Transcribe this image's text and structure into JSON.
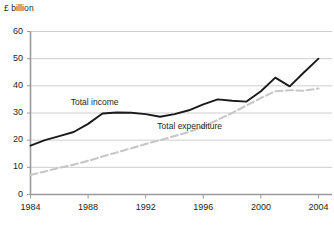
{
  "chart_data": {
    "type": "line",
    "title": "",
    "subtitle": "",
    "ylabel": "£ billion",
    "xlabel": "",
    "ylim": [
      0,
      60
    ],
    "xlim": [
      1984,
      2004
    ],
    "yticks": [
      "0",
      "10",
      "20",
      "30",
      "40",
      "50",
      "60"
    ],
    "ytick_values": [
      0,
      10,
      20,
      30,
      40,
      50,
      60
    ],
    "xticks": [
      "1984",
      "1988",
      "1992",
      "1996",
      "2000",
      "2004"
    ],
    "xtick_values": [
      1984,
      1988,
      1992,
      1996,
      2000,
      2004
    ],
    "grid": true,
    "grid_axis": "y",
    "legend": "inline-annotations",
    "x": [
      1984,
      1985,
      1986,
      1987,
      1988,
      1989,
      1990,
      1991,
      1992,
      1993,
      1994,
      1995,
      1996,
      1997,
      1998,
      1999,
      2000,
      2001,
      2002,
      2003,
      2004
    ],
    "series": [
      {
        "name": "Total income",
        "style": "solid",
        "color": "#1a1a1a",
        "width": 1.9,
        "label_x": 1988.6,
        "label_y": 33.5,
        "values": [
          18.0,
          20.0,
          21.5,
          23.0,
          26.0,
          29.8,
          30.2,
          30.1,
          29.6,
          28.6,
          29.6,
          31.0,
          33.2,
          35.0,
          34.5,
          34.2,
          38.0,
          43.0,
          39.8,
          45.0,
          50.0
        ]
      },
      {
        "name": "Total expenditure",
        "style": "dashed",
        "color": "#c7c7c7",
        "width": 2.1,
        "label_x": 1995.1,
        "label_y": 25.0,
        "values": [
          7.2,
          8.5,
          9.8,
          11.0,
          12.4,
          14.0,
          15.5,
          17.0,
          18.6,
          20.0,
          21.5,
          23.0,
          25.0,
          27.5,
          30.0,
          32.8,
          35.5,
          38.0,
          38.4,
          38.2,
          39.0
        ]
      }
    ]
  },
  "axis": {
    "y_axis_color": "#9a9a9a",
    "x_axis_color": "#9a9a9a",
    "grid_color": "#c8c8c8"
  }
}
